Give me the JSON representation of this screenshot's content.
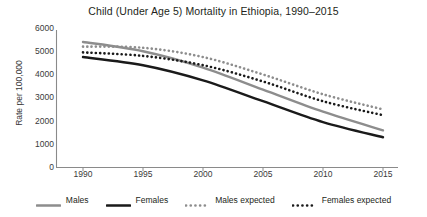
{
  "chart_data": {
    "type": "line",
    "title": "Child (Under Age 5) Mortality in Ethiopia, 1990–2015",
    "xlabel": "",
    "ylabel": "Rate per 100,000",
    "x": [
      1990,
      1995,
      2000,
      2005,
      2010,
      2015
    ],
    "xlim": [
      1989,
      2016.5
    ],
    "ylim": [
      0,
      6000
    ],
    "yticks": [
      0,
      1000,
      2000,
      3000,
      4000,
      5000,
      6000
    ],
    "ytick_labels": [
      "0",
      "1000",
      "2000",
      "3000",
      "4000",
      "5000",
      "6000"
    ],
    "xticks": [
      1990,
      1995,
      2000,
      2005,
      2010,
      2015
    ],
    "xtick_labels": [
      "1990",
      "1995",
      "2000",
      "2005",
      "2010",
      "2015"
    ],
    "grid": false,
    "legend_position": "bottom",
    "series": [
      {
        "name": "Males",
        "style": "solid",
        "color": "#8d8d8d",
        "values": [
          5400,
          5000,
          4300,
          3350,
          2400,
          1600
        ]
      },
      {
        "name": "Females",
        "style": "solid",
        "color": "#1a1a1a",
        "values": [
          4750,
          4400,
          3750,
          2850,
          1950,
          1300
        ]
      },
      {
        "name": "Males expected",
        "style": "dotted",
        "color": "#8d8d8d",
        "values": [
          5200,
          5150,
          4750,
          4000,
          3150,
          2500
        ]
      },
      {
        "name": "Females expected",
        "style": "dotted",
        "color": "#1a1a1a",
        "values": [
          4950,
          4800,
          4400,
          3700,
          2850,
          2250
        ]
      }
    ]
  },
  "legend": {
    "items": [
      {
        "label": "Males",
        "swatch": "solid-gray-line-swatch"
      },
      {
        "label": "Females",
        "swatch": "solid-black-line-swatch"
      },
      {
        "label": "Males expected",
        "swatch": "dotted-gray-line-swatch"
      },
      {
        "label": "Females expected",
        "swatch": "dotted-black-line-swatch"
      }
    ]
  },
  "axis_colors": {
    "axis_line": "#808080",
    "text": "#231f20"
  }
}
